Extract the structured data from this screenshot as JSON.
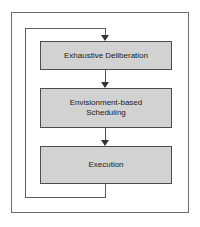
{
  "figure": {
    "type": "flowchart",
    "orientation": "vertical",
    "nodes": [
      {
        "id": "exhaustive-deliberation",
        "label": "Exhaustive Deliberation"
      },
      {
        "id": "envisionment-based-scheduling",
        "label": "Envisionment-based\nScheduling"
      },
      {
        "id": "execution",
        "label": "Execution"
      }
    ],
    "edges": [
      {
        "from": "exhaustive-deliberation",
        "to": "envisionment-based-scheduling",
        "style": "arrow-down"
      },
      {
        "from": "envisionment-based-scheduling",
        "to": "execution",
        "style": "arrow-down"
      },
      {
        "from": "execution",
        "to": "exhaustive-deliberation",
        "style": "feedback-loop-left"
      }
    ],
    "colors": {
      "box_fill": "#d2d2d2",
      "box_border": "#4d4d4d",
      "line": "#5d5d5d",
      "frame": "#6b6b6b",
      "background": "#ffffff",
      "text": "#1a1a1a"
    }
  }
}
